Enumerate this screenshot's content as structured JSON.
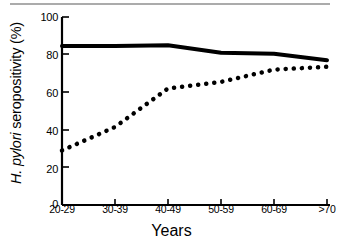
{
  "figure": {
    "background": "#ffffff",
    "ink_color": "#000000",
    "scan_artifact_color": "#8f8f8f"
  },
  "axis": {
    "y_label_prefix": "H. pylori",
    "y_label_suffix": " seropositivity (%)",
    "x_title": "Years",
    "y_ticks": [
      "100",
      "80",
      "60",
      "40",
      "20",
      "0"
    ],
    "x_ticks": [
      "20-29",
      "30-39",
      "40-49",
      "50-59",
      "60-69",
      ">70"
    ]
  },
  "chart_data": {
    "type": "line",
    "title": "",
    "xlabel": "Years",
    "ylabel": "H. pylori seropositivity (%)",
    "categories": [
      "20-29",
      "30-39",
      "40-49",
      "50-59",
      "60-69",
      ">70"
    ],
    "ylim": [
      0,
      100
    ],
    "xlim_categories": 6,
    "yticks": [
      0,
      20,
      40,
      60,
      80,
      100
    ],
    "grid": false,
    "legend": "none",
    "series": [
      {
        "name": "solid-line-series",
        "style": "solid",
        "linewidth": 4,
        "color": "#000000",
        "values": [
          84.5,
          84.5,
          85,
          81,
          80.5,
          77
        ]
      },
      {
        "name": "dotted-line-series",
        "style": "dotted",
        "linewidth": 4.5,
        "color": "#000000",
        "values": [
          29,
          41.5,
          62,
          65.5,
          72,
          73.5
        ]
      }
    ]
  }
}
